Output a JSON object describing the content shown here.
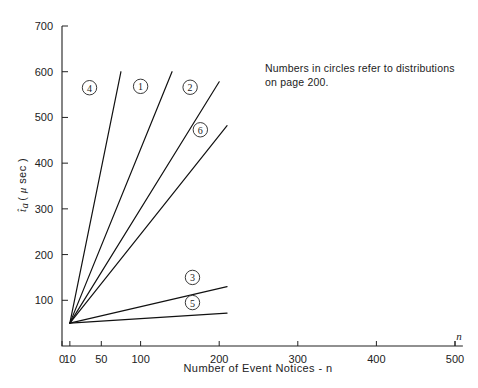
{
  "chart_data": {
    "type": "line",
    "title": "",
    "xlabel": "Number of Event Notices - n",
    "ylabel": "t̂a ( μ sec )",
    "xlim": [
      0,
      510
    ],
    "ylim": [
      0,
      700
    ],
    "grid": false,
    "legend": "inline-circled-numbers",
    "xticks": [
      0,
      10,
      50,
      100,
      200,
      300,
      400,
      500
    ],
    "xtick_labels": [
      "0",
      "10",
      "50",
      "100",
      "200",
      "300",
      "400",
      "500"
    ],
    "yticks": [
      100,
      200,
      300,
      400,
      500,
      600,
      700
    ],
    "ytick_labels": [
      "100",
      "200",
      "300",
      "400",
      "500",
      "600",
      "700"
    ],
    "x_axis_end_symbol": "n",
    "annotation": {
      "line1": "Numbers in circles refer to distributions",
      "line2": "on page 200."
    },
    "common_origin": {
      "x": 10,
      "y": 50
    },
    "series": [
      {
        "name": "4",
        "label": "4",
        "x": [
          10,
          75
        ],
        "y": [
          50,
          600
        ],
        "label_at": {
          "x": 35,
          "y": 565
        }
      },
      {
        "name": "1",
        "label": "1",
        "x": [
          10,
          140
        ],
        "y": [
          50,
          600
        ],
        "label_at": {
          "x": 100,
          "y": 568
        }
      },
      {
        "name": "2",
        "label": "2",
        "x": [
          10,
          200
        ],
        "y": [
          50,
          578
        ],
        "label_at": {
          "x": 163,
          "y": 566
        }
      },
      {
        "name": "6",
        "label": "6",
        "x": [
          10,
          210
        ],
        "y": [
          50,
          482
        ],
        "label_at": {
          "x": 176,
          "y": 473
        }
      },
      {
        "name": "3",
        "label": "3",
        "x": [
          10,
          210
        ],
        "y": [
          50,
          130
        ],
        "label_at": {
          "x": 166,
          "y": 150
        }
      },
      {
        "name": "5",
        "label": "5",
        "x": [
          10,
          210
        ],
        "y": [
          50,
          72
        ],
        "label_at": {
          "x": 166,
          "y": 95
        }
      }
    ]
  }
}
